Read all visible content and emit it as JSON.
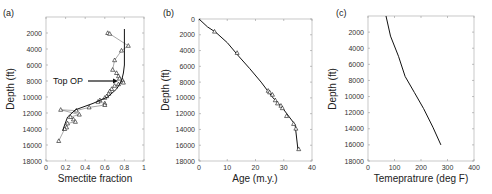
{
  "chart_data": [
    {
      "type": "scatter",
      "panel": "(a)",
      "title": "",
      "xlabel": "Smectite fraction",
      "ylabel": "Depth (ft)",
      "xlim": [
        0,
        1
      ],
      "ylim": [
        18000,
        0
      ],
      "y_inverted": true,
      "xticks": [
        "0",
        "0.2",
        "0.4",
        "0.6",
        "0.8",
        "1"
      ],
      "yticks": [
        "2000",
        "4000",
        "6000",
        "8000",
        "10000",
        "12000",
        "14000",
        "16000",
        "18000"
      ],
      "annotations": [
        {
          "text": "Top OP",
          "arrow_to": [
            0.75,
            7900
          ]
        }
      ],
      "series": [
        {
          "name": "measured",
          "marker": "triangle",
          "connected": true,
          "points": [
            [
              0.63,
              2000
            ],
            [
              0.65,
              2100
            ],
            [
              0.84,
              3600
            ],
            [
              0.77,
              4200
            ],
            [
              0.7,
              5400
            ],
            [
              0.68,
              6600
            ],
            [
              0.72,
              7000
            ],
            [
              0.74,
              7400
            ],
            [
              0.75,
              7700
            ],
            [
              0.78,
              7900
            ],
            [
              0.79,
              8200
            ],
            [
              0.74,
              8400
            ],
            [
              0.7,
              8600
            ],
            [
              0.67,
              9000
            ],
            [
              0.65,
              9300
            ],
            [
              0.64,
              9600
            ],
            [
              0.62,
              9900
            ],
            [
              0.6,
              10100
            ],
            [
              0.55,
              10400
            ],
            [
              0.53,
              10600
            ],
            [
              0.6,
              10800
            ],
            [
              0.6,
              11000
            ],
            [
              0.44,
              11300
            ],
            [
              0.31,
              11700
            ],
            [
              0.15,
              11600
            ],
            [
              0.34,
              12200
            ],
            [
              0.25,
              12500
            ],
            [
              0.28,
              12800
            ],
            [
              0.3,
              13100
            ],
            [
              0.22,
              13300
            ],
            [
              0.21,
              13800
            ],
            [
              0.19,
              14000
            ],
            [
              0.13,
              15500
            ]
          ]
        },
        {
          "name": "model",
          "marker": "none",
          "points": [
            [
              0.8,
              1500
            ],
            [
              0.8,
              4000
            ],
            [
              0.8,
              6000
            ],
            [
              0.79,
              7000
            ],
            [
              0.77,
              8000
            ],
            [
              0.72,
              9000
            ],
            [
              0.63,
              10000
            ],
            [
              0.48,
              10800
            ],
            [
              0.3,
              11600
            ],
            [
              0.22,
              12500
            ],
            [
              0.19,
              13500
            ],
            [
              0.17,
              14200
            ]
          ]
        }
      ]
    },
    {
      "type": "line",
      "panel": "(b)",
      "xlabel": "Age (m.y.)",
      "ylabel": "Depth (ft)",
      "xlim": [
        0,
        40
      ],
      "ylim": [
        18000,
        0
      ],
      "y_inverted": true,
      "xticks": [
        "0",
        "10",
        "20",
        "30",
        "40"
      ],
      "yticks": [
        "0",
        "2000",
        "4000",
        "6000",
        "8000",
        "10000",
        "12000",
        "14000",
        "16000",
        "18000"
      ],
      "series": [
        {
          "name": "model",
          "marker": "none",
          "points": [
            [
              0,
              0
            ],
            [
              3,
              1000
            ],
            [
              6,
              1700
            ],
            [
              10,
              3000
            ],
            [
              14,
              4700
            ],
            [
              18,
              6300
            ],
            [
              22,
              8000
            ],
            [
              26,
              9900
            ],
            [
              30,
              11500
            ],
            [
              34,
              13400
            ],
            [
              35,
              16500
            ]
          ]
        },
        {
          "name": "data",
          "marker": "triangle",
          "points": [
            [
              5.5,
              1600
            ],
            [
              13.5,
              4300
            ],
            [
              24.5,
              9100
            ],
            [
              25,
              9300
            ],
            [
              26,
              9600
            ],
            [
              27,
              10300
            ],
            [
              27.8,
              10700
            ],
            [
              29,
              11000
            ],
            [
              29.5,
              11300
            ],
            [
              31,
              12300
            ],
            [
              33.5,
              13300
            ],
            [
              34.3,
              13900
            ],
            [
              35.3,
              16500
            ]
          ]
        }
      ]
    },
    {
      "type": "line",
      "panel": "(c)",
      "xlabel": "Temepratrure (deg F)",
      "ylabel": "Depth (ft)",
      "xlim": [
        0,
        400
      ],
      "ylim": [
        18000,
        0
      ],
      "y_inverted": true,
      "xticks": [
        "0",
        "100",
        "200",
        "300",
        "400"
      ],
      "yticks": [
        "2000",
        "4000",
        "6000",
        "8000",
        "10000",
        "12000",
        "14000",
        "16000",
        "18000"
      ],
      "series": [
        {
          "name": "temperature",
          "marker": "none",
          "points": [
            [
              68,
              0
            ],
            [
              85,
              2500
            ],
            [
              115,
              5000
            ],
            [
              140,
              7500
            ],
            [
              175,
              9500
            ],
            [
              210,
              11500
            ],
            [
              245,
              13800
            ],
            [
              275,
              16000
            ]
          ]
        }
      ]
    }
  ],
  "labels": {
    "a": {
      "panel": "(a)",
      "xlabel": "Smectite fraction",
      "ylabel": "Depth (ft)",
      "annot": "Top OP"
    },
    "b": {
      "panel": "(b)",
      "xlabel": "Age (m.y.)",
      "ylabel": "Depth (ft)"
    },
    "c": {
      "panel": "(c)",
      "xlabel": "Temepratrure (deg F)",
      "ylabel": "Depth (ft)"
    }
  }
}
